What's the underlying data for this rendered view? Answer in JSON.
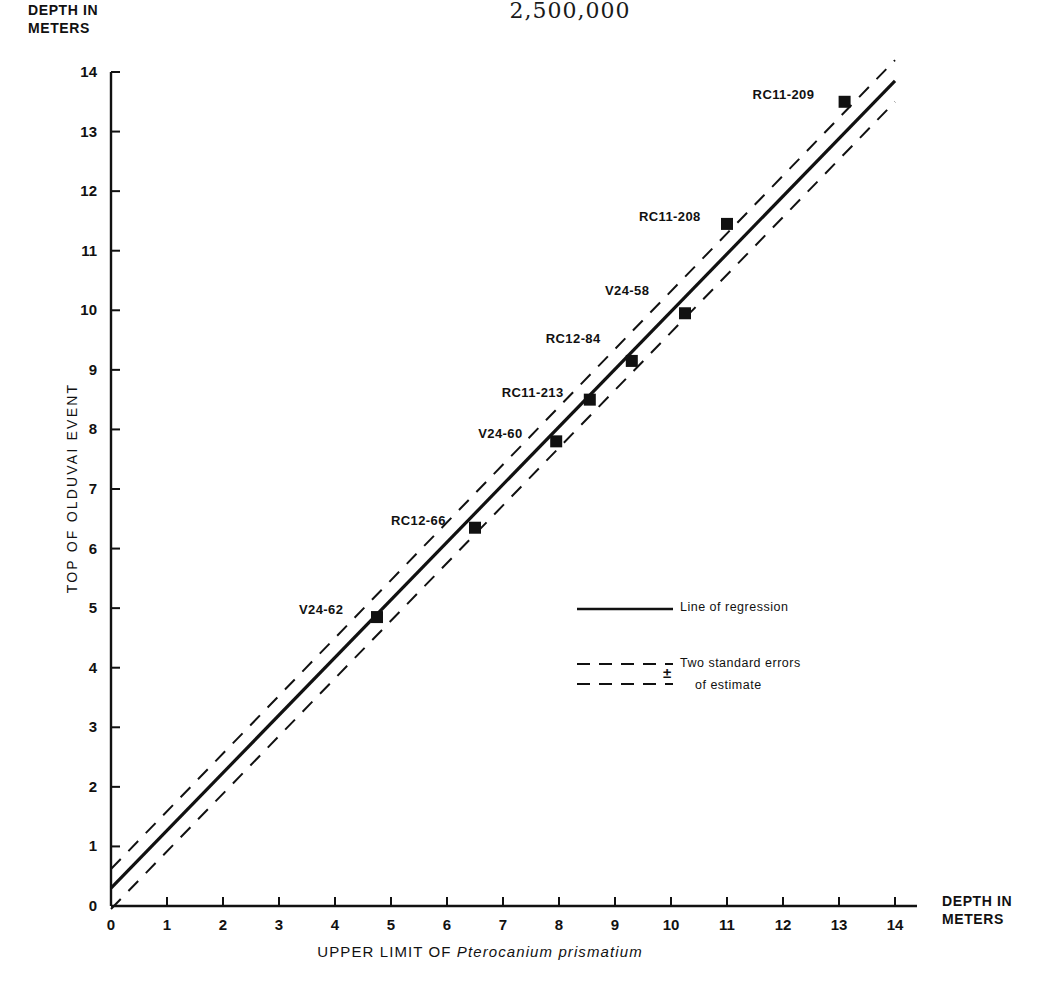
{
  "header": {
    "fraction_denominator": "2,500,000",
    "has_rule": true
  },
  "axes": {
    "y_top_label": "DEPTH IN METERS",
    "y_title": "TOP OF OLDUVAI EVENT",
    "x_right_label": "DEPTH IN METERS",
    "x_title_prefix": "UPPER LIMIT OF ",
    "x_title_species": "Pterocanium prismatium"
  },
  "legend": {
    "regression_label": "Line of regression",
    "error_symbol": "±",
    "error_label_line1": "Two standard errors",
    "error_label_line2": "of estimate"
  },
  "chart_data": {
    "type": "scatter",
    "title": "",
    "xlabel": "UPPER LIMIT OF Pterocanium prismatium (DEPTH IN METERS)",
    "ylabel": "TOP OF OLDUVAI EVENT (DEPTH IN METERS)",
    "xlim": [
      0,
      14
    ],
    "ylim": [
      0,
      14
    ],
    "xticks": [
      0,
      1,
      2,
      3,
      4,
      5,
      6,
      7,
      8,
      9,
      10,
      11,
      12,
      13,
      14
    ],
    "yticks": [
      0,
      1,
      2,
      3,
      4,
      5,
      6,
      7,
      8,
      9,
      10,
      11,
      12,
      13,
      14
    ],
    "xtick_labels": [
      "0",
      "1",
      "2",
      "3",
      "4",
      "5",
      "6",
      "7",
      "8",
      "9",
      "10",
      "11",
      "12",
      "13",
      "14"
    ],
    "ytick_labels": [
      "0",
      "1",
      "2",
      "3",
      "4",
      "5",
      "6",
      "7",
      "8",
      "9",
      "10",
      "11",
      "12",
      "13",
      "14"
    ],
    "grid": false,
    "legend_position": "center-right",
    "points": [
      {
        "label": "V24-62",
        "x": 4.75,
        "y": 4.85,
        "label_dx": -78,
        "label_dy": -7
      },
      {
        "label": "RC12-66",
        "x": 6.5,
        "y": 6.35,
        "label_dx": -84,
        "label_dy": -7
      },
      {
        "label": "V24-60",
        "x": 7.95,
        "y": 7.8,
        "label_dx": -78,
        "label_dy": -7
      },
      {
        "label": "RC11-213",
        "x": 8.55,
        "y": 8.5,
        "label_dx": -88,
        "label_dy": -7
      },
      {
        "label": "RC12-84",
        "x": 9.3,
        "y": 9.15,
        "label_dx": -86,
        "label_dy": -22
      },
      {
        "label": "V24-58",
        "x": 10.25,
        "y": 9.95,
        "label_dx": -80,
        "label_dy": -22
      },
      {
        "label": "RC11-208",
        "x": 11.0,
        "y": 11.45,
        "label_dx": -88,
        "label_dy": -7
      },
      {
        "label": "RC11-209",
        "x": 13.1,
        "y": 13.5,
        "label_dx": -92,
        "label_dy": -7
      }
    ],
    "series": [
      {
        "name": "Line of regression",
        "style": "solid",
        "x": [
          0,
          14
        ],
        "y": [
          0.3,
          13.85
        ]
      },
      {
        "name": "Upper two standard errors of estimate",
        "style": "dashed",
        "x": [
          0,
          14
        ],
        "y": [
          0.62,
          14.2
        ]
      },
      {
        "name": "Lower two standard errors of estimate",
        "style": "dashed",
        "x": [
          0,
          14
        ],
        "y": [
          -0.05,
          13.5
        ]
      }
    ]
  }
}
